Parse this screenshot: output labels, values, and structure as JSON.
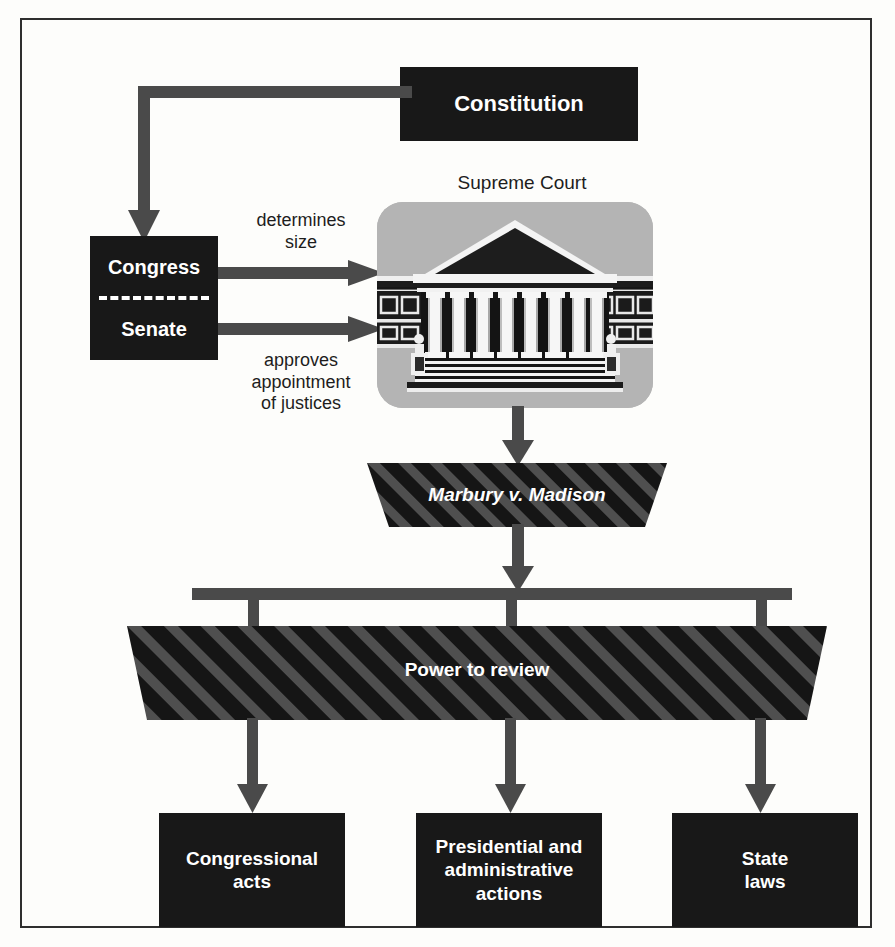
{
  "diagram": {
    "nodes": {
      "constitution": "Constitution",
      "congress": "Congress",
      "senate": "Senate",
      "supreme_court_title": "Supreme Court",
      "marbury": "Marbury v. Madison",
      "power_to_review": "Power to review",
      "congressional_acts": "Congressional\nacts",
      "congressional_acts_line1": "Congressional",
      "congressional_acts_line2": "acts",
      "presidential_line1": "Presidential and",
      "presidential_line2": "administrative",
      "presidential_line3": "actions",
      "state_laws_line1": "State",
      "state_laws_line2": "laws"
    },
    "edge_labels": {
      "determines_size_line1": "determines",
      "determines_size_line2": "size",
      "approves_line1": "approves",
      "approves_line2": "appointment",
      "approves_line3": "of justices"
    },
    "colors": {
      "box_fill": "#181818",
      "box_text": "#ffffff",
      "page_background": "#fdfdfb",
      "frame_border": "#2e2e2e",
      "panel_gray": "#b4b4b4",
      "connector": "#4a4a4a",
      "stripe_dark": "#161616",
      "stripe_light": "#4f4f4f",
      "label_text": "#1d1d1d"
    },
    "icons": {
      "supreme_court": "courthouse-icon"
    }
  }
}
